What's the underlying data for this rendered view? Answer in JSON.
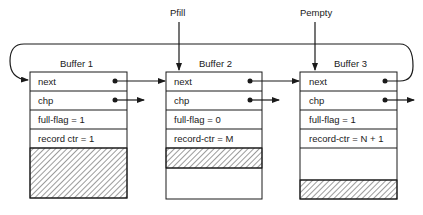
{
  "pointers": [
    {
      "label": "Pfill",
      "target": "Buffer 2"
    },
    {
      "label": "Pempty",
      "target": "Buffer 3"
    }
  ],
  "buffers": [
    {
      "title": "Buffer 1",
      "fields": [
        "next",
        "chp",
        "full-flag = 1",
        "record ctr = 1"
      ]
    },
    {
      "title": "Buffer 2",
      "fields": [
        "next",
        "chp",
        "full-flag = 0",
        "record-ctr = M"
      ]
    },
    {
      "title": "Buffer 3",
      "fields": [
        "next",
        "chp",
        "full-flag = 1",
        "record-ctr = N + 1"
      ]
    }
  ],
  "colors": {
    "line": "#1a1a1a",
    "background": "#ffffff"
  }
}
